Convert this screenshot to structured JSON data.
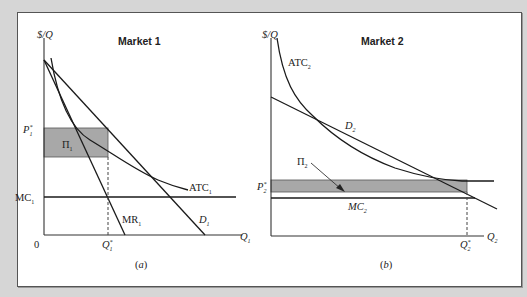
{
  "figure": {
    "panel_a": {
      "title": "Market 1",
      "y_axis_label": "$/Q",
      "x_axis_label": "Q",
      "x_axis_sub": "1",
      "origin": "0",
      "price_label": "P",
      "price_sup": "*",
      "price_sub": "1",
      "quantity_label": "Q",
      "quantity_sup": "*",
      "quantity_sub": "1",
      "mc_label": "MC",
      "mc_sub": "1",
      "profit_label": "Π",
      "profit_sub": "1",
      "atc_label": "ATC",
      "atc_sub": "1",
      "mr_label": "MR",
      "mr_sub": "1",
      "demand_label": "D",
      "demand_sub": "1",
      "caption": "(a)"
    },
    "panel_b": {
      "title": "Market 2",
      "y_axis_label": "$/Q",
      "x_axis_label": "Q",
      "x_axis_sub": "2",
      "price_label": "P",
      "price_sup": "*",
      "price_sub": "2",
      "quantity_label": "Q",
      "quantity_sup": "*",
      "quantity_sub": "2",
      "mc_label": "MC",
      "mc_sub": "2",
      "profit_label": "Π",
      "profit_sub": "2",
      "atc_label": "ATC",
      "atc_sub": "2",
      "demand_label": "D",
      "demand_sub": "2",
      "caption": "(b)"
    },
    "colors": {
      "background": "#d6d6d6",
      "panel": "#ffffff",
      "profit_shade": "#a8a8a8",
      "line": "#1a1a1a"
    }
  }
}
